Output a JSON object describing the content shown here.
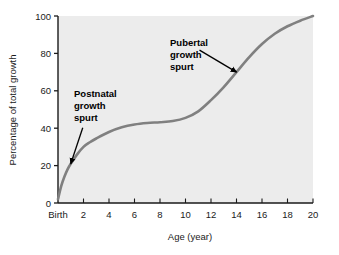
{
  "chart_data": {
    "type": "line",
    "title": "",
    "subtitle": "",
    "xlabel": "Age (year)",
    "ylabel": "Percentage of total growth",
    "xlim": [
      0,
      20
    ],
    "ylim": [
      0,
      100
    ],
    "grid": false,
    "legend": null,
    "plot_background": "#ececec",
    "series_color": "#808080",
    "x_tick_labels": [
      "Birth",
      "2",
      "4",
      "6",
      "8",
      "10",
      "12",
      "14",
      "16",
      "18",
      "20"
    ],
    "x_tick_values": [
      0,
      2,
      4,
      6,
      8,
      10,
      12,
      14,
      16,
      18,
      20
    ],
    "y_tick_labels": [
      "0",
      "20",
      "40",
      "60",
      "80",
      "100"
    ],
    "y_tick_values": [
      0,
      20,
      40,
      60,
      80,
      100
    ],
    "series": [
      {
        "name": "Percentage of total growth",
        "x": [
          0,
          0.25,
          0.5,
          0.75,
          1,
          1.5,
          2,
          2.5,
          3,
          4,
          5,
          6,
          7,
          8,
          9,
          10,
          11,
          12,
          13,
          14,
          15,
          16,
          17,
          18,
          19,
          20
        ],
        "values": [
          2,
          9,
          14,
          18,
          21,
          26,
          30,
          32.5,
          34.5,
          38,
          40.5,
          42,
          42.8,
          43.2,
          43.8,
          45.5,
          49,
          55,
          62,
          70,
          78,
          85,
          90.5,
          94.5,
          97.5,
          100
        ]
      }
    ],
    "annotations": [
      {
        "id": "postnatal",
        "lines": [
          "Postnatal",
          "growth",
          "spurt"
        ],
        "text": "Postnatal growth spurt",
        "target_x": 1.0,
        "target_y": 21
      },
      {
        "id": "pubertal",
        "lines": [
          "Pubertal",
          "growth",
          "spurt"
        ],
        "text": "Pubertal growth spurt",
        "target_x": 14.0,
        "target_y": 70
      }
    ]
  }
}
